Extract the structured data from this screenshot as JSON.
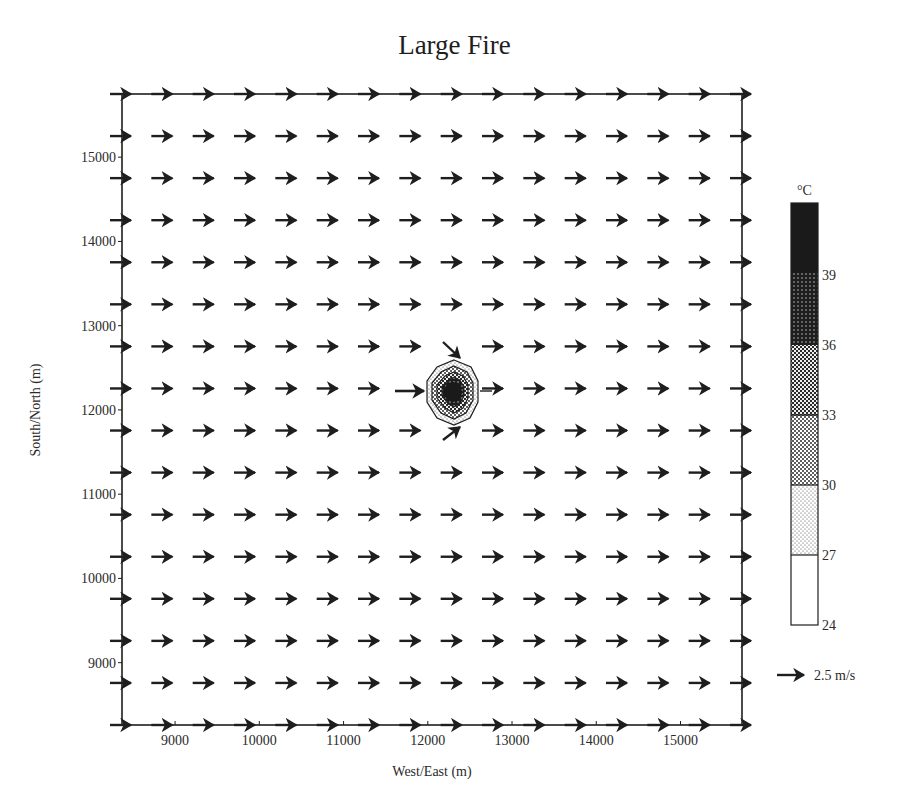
{
  "chart_data": {
    "type": "vector-field-contour",
    "title": "Large Fire",
    "xlabel": "West/East (m)",
    "ylabel": "South/North (m)",
    "xlim": [
      8370,
      15730
    ],
    "ylim": [
      8260,
      15750
    ],
    "x_ticks": [
      9000,
      10000,
      11000,
      12000,
      13000,
      14000,
      15000
    ],
    "y_ticks": [
      9000,
      10000,
      11000,
      12000,
      13000,
      14000,
      15000
    ],
    "grid": false,
    "vector_field": {
      "description": "Uniform eastward wind on a 16x16 grid, converging toward the fire center",
      "grid_columns": 16,
      "grid_rows": 16,
      "uniform_u_ms": 2.5,
      "uniform_v_ms": 0.0,
      "perturbed_vectors": [
        {
          "position": "north-west of fire",
          "direction": "south-east (toward fire)"
        },
        {
          "position": "west of fire",
          "direction": "east (strong inflow)"
        },
        {
          "position": "south-west of fire",
          "direction": "north-east (toward fire)"
        }
      ],
      "reference_vector": {
        "label": "2.5 m/s",
        "value_ms": 2.5
      }
    },
    "contour": {
      "variable": "Temperature",
      "unit": "°C",
      "center": [
        12300,
        12200
      ],
      "max_radius_m": 450,
      "levels": [
        24,
        27,
        30,
        33,
        36,
        39
      ]
    },
    "legend": {
      "title": "°C",
      "levels": [
        "39",
        "36",
        "33",
        "30",
        "27",
        "24"
      ],
      "position": "right",
      "bands": [
        {
          "range": "> 39",
          "fill": "solid-black"
        },
        {
          "range": "36-39",
          "fill": "dense-dots-dark"
        },
        {
          "range": "33-36",
          "fill": "checker-dark"
        },
        {
          "range": "30-33",
          "fill": "checker-medium"
        },
        {
          "range": "27-30",
          "fill": "dots-light"
        },
        {
          "range": "24-27",
          "fill": "white"
        }
      ]
    }
  },
  "title": "Large Fire",
  "axes": {
    "xlabel": "West/East (m)",
    "ylabel": "South/North (m)",
    "x_ticks": [
      "9000",
      "10000",
      "11000",
      "12000",
      "13000",
      "14000",
      "15000"
    ],
    "y_ticks": [
      "15000",
      "14000",
      "13000",
      "12000",
      "11000",
      "10000",
      "9000"
    ]
  },
  "legend": {
    "unit": "°C",
    "labels": [
      "39",
      "36",
      "33",
      "30",
      "27",
      "24"
    ],
    "reference_vector_label": "2.5 m/s"
  },
  "colors": {
    "ink": "#1e1e1e",
    "background": "#ffffff"
  }
}
